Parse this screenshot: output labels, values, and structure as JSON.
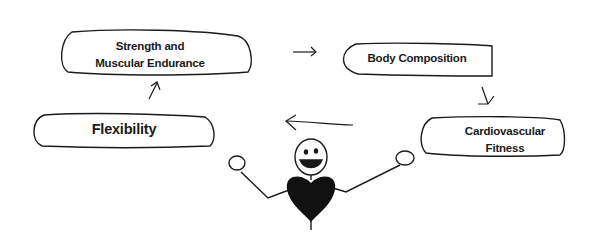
{
  "diagram": {
    "title": "",
    "nodes": [
      {
        "id": "strength",
        "label_line1": "Strength and",
        "label_line2": "Muscular Endurance"
      },
      {
        "id": "body",
        "label": "Body Composition"
      },
      {
        "id": "cardio",
        "label_line1": "Cardiovascular",
        "label_line2": "Fitness"
      },
      {
        "id": "flexibility",
        "label": "Flexibility"
      }
    ],
    "edges": [
      {
        "from": "strength",
        "to": "body",
        "direction": "right"
      },
      {
        "from": "body",
        "to": "cardio",
        "direction": "down-right"
      },
      {
        "from": "cardio",
        "to": "flexibility",
        "direction": "left"
      },
      {
        "from": "flexibility",
        "to": "strength",
        "direction": "up-right"
      }
    ],
    "figure": "stick-figure-with-heart",
    "colors": {
      "ink": "#1a1a1a",
      "background": "#ffffff"
    }
  }
}
